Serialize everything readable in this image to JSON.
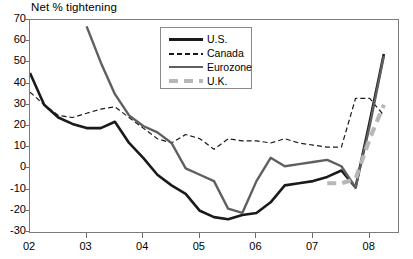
{
  "chart_data": {
    "type": "line",
    "title": "Net % tightening",
    "xlabel": "",
    "ylabel": "",
    "ylim": [
      -30,
      70
    ],
    "xlim": [
      2002.0,
      2008.5
    ],
    "yticks": [
      70,
      60,
      50,
      40,
      30,
      20,
      10,
      0,
      -10,
      -20,
      -30
    ],
    "xticks": [
      2002,
      2003,
      2004,
      2005,
      2006,
      2007,
      2008
    ],
    "xticklabels": [
      "02",
      "03",
      "04",
      "05",
      "06",
      "07",
      "08"
    ],
    "grid": false,
    "legend_position": "top-center",
    "series": [
      {
        "name": "U.S.",
        "color": "#1a1a1a",
        "style": "solid",
        "width": 2.6,
        "x": [
          2002.0,
          2002.25,
          2002.5,
          2002.75,
          2003.0,
          2003.25,
          2003.5,
          2003.75,
          2004.0,
          2004.25,
          2004.5,
          2004.75,
          2005.0,
          2005.25,
          2005.5,
          2005.75,
          2006.0,
          2006.25,
          2006.5,
          2006.75,
          2007.0,
          2007.25,
          2007.5,
          2007.75,
          2008.0,
          2008.25
        ],
        "values": [
          45,
          30,
          24,
          21,
          19,
          19,
          22,
          12,
          5,
          -3,
          -8,
          -12,
          -20,
          -23,
          -24,
          -22,
          -21,
          -16,
          -8,
          -7,
          -6,
          -4,
          -1,
          -9,
          22,
          54
        ]
      },
      {
        "name": "Canada",
        "color": "#1a1a1a",
        "style": "dashed",
        "width": 1.2,
        "x": [
          2002.0,
          2002.25,
          2002.5,
          2002.75,
          2003.0,
          2003.25,
          2003.5,
          2003.75,
          2004.0,
          2004.25,
          2004.5,
          2004.75,
          2005.0,
          2005.25,
          2005.5,
          2005.75,
          2006.0,
          2006.25,
          2006.5,
          2006.75,
          2007.0,
          2007.25,
          2007.5,
          2007.75,
          2008.0,
          2008.25
        ],
        "values": [
          36,
          30,
          25,
          24,
          26,
          28,
          29,
          24,
          19,
          14,
          12,
          16,
          14,
          9,
          14,
          13,
          13,
          12,
          14,
          12,
          11,
          10,
          10,
          33,
          33,
          25
        ]
      },
      {
        "name": "Eurozone",
        "color": "#5f5f5f",
        "style": "solid",
        "width": 2.4,
        "x": [
          2003.0,
          2003.25,
          2003.5,
          2003.75,
          2004.0,
          2004.25,
          2004.5,
          2004.75,
          2005.0,
          2005.25,
          2005.5,
          2005.75,
          2006.0,
          2006.25,
          2006.5,
          2006.75,
          2007.0,
          2007.25,
          2007.5,
          2007.75,
          2008.0,
          2008.25
        ],
        "values": [
          67,
          50,
          35,
          25,
          20,
          17,
          12,
          0,
          -3,
          -6,
          -19,
          -21,
          -6,
          5,
          1,
          2,
          3,
          4,
          1,
          -9,
          20,
          53
        ]
      },
      {
        "name": "U.K.",
        "color": "#b7b7b7",
        "style": "dashed",
        "width": 4.2,
        "x": [
          2007.25,
          2007.5,
          2007.75,
          2008.0,
          2008.25
        ],
        "values": [
          -7,
          -7,
          -5,
          14,
          30
        ]
      }
    ]
  },
  "legend": {
    "items": [
      {
        "label": "U.S."
      },
      {
        "label": "Canada"
      },
      {
        "label": "Eurozone"
      },
      {
        "label": "U.K."
      }
    ]
  }
}
